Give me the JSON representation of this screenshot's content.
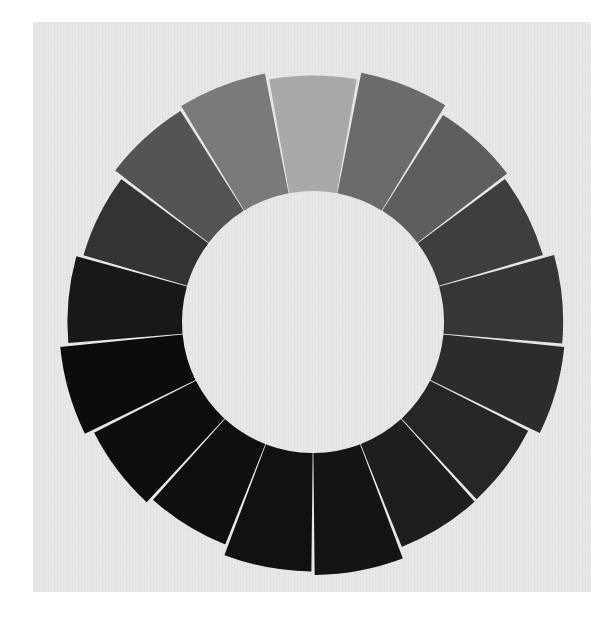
{
  "image": {
    "subject": "painted grayscale value wheel on canvas",
    "background_color": "#e9e9e9",
    "page_color": "#ffffff",
    "wheel": {
      "center": [
        313,
        322
      ],
      "outer_radius": 253,
      "inner_radius": 132,
      "segment_count": 16,
      "segments": [
        {
          "index": 0,
          "tone": "#a9a9a9"
        },
        {
          "index": 1,
          "tone": "#6b6b6b"
        },
        {
          "index": 2,
          "tone": "#5e5e5e"
        },
        {
          "index": 3,
          "tone": "#3e3e3e"
        },
        {
          "index": 4,
          "tone": "#363636"
        },
        {
          "index": 5,
          "tone": "#2c2c2c"
        },
        {
          "index": 6,
          "tone": "#262626"
        },
        {
          "index": 7,
          "tone": "#1e1e1e"
        },
        {
          "index": 8,
          "tone": "#141414"
        },
        {
          "index": 9,
          "tone": "#111111"
        },
        {
          "index": 10,
          "tone": "#0f0f0f"
        },
        {
          "index": 11,
          "tone": "#0d0d0d"
        },
        {
          "index": 12,
          "tone": "#0c0c0c"
        },
        {
          "index": 13,
          "tone": "#181818"
        },
        {
          "index": 14,
          "tone": "#333333"
        },
        {
          "index": 15,
          "tone": "#545454"
        },
        {
          "index": 16,
          "tone": "#7a7a7a"
        }
      ]
    }
  }
}
